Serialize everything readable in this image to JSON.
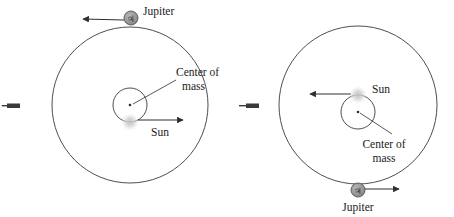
{
  "figure": {
    "background_color": "#ffffff",
    "stroke_color": "#3a3a3a",
    "jupiter_fill": "#9a9a9a",
    "jupiter_stroke": "#555555",
    "sun_fill": "#cccccc",
    "text_color": "#1a1a1a"
  },
  "panels": [
    {
      "id": "left-panel",
      "name": "panel-left",
      "orbit": {
        "center_x": 130,
        "center_y": 105,
        "radius": 78
      },
      "inner_circle": {
        "center_x": 130,
        "center_y": 105,
        "radius": 17
      },
      "center_of_mass": {
        "label_line_1": "Center of",
        "label_line_2": "mass",
        "dot_x": 130,
        "dot_y": 105,
        "label_x": 176,
        "label_y": 76
      },
      "sun": {
        "label": "Sun",
        "x": 130,
        "y": 122,
        "radius": 8,
        "arrow_direction": "right",
        "label_x": 151,
        "label_y": 136
      },
      "jupiter": {
        "label": "Jupiter",
        "symbol": "♃",
        "x": 131,
        "y": 18,
        "radius": 7,
        "arrow_direction": "left",
        "label_x": 143,
        "label_y": 15
      },
      "edge_marker": {
        "name": "edge-arrow-marker",
        "x": 8,
        "y": 106
      }
    },
    {
      "id": "right-panel",
      "name": "panel-right",
      "orbit": {
        "center_x": 358,
        "center_y": 105,
        "radius": 79
      },
      "inner_circle": {
        "center_x": 358,
        "center_y": 112,
        "radius": 17
      },
      "center_of_mass": {
        "label_line_1": "Center of",
        "label_line_2": "mass",
        "dot_x": 358,
        "dot_y": 112,
        "label_x": 384,
        "label_y": 144
      },
      "sun": {
        "label": "Sun",
        "x": 358,
        "y": 95,
        "radius": 8,
        "arrow_direction": "left",
        "label_x": 372,
        "label_y": 93
      },
      "jupiter": {
        "label": "Jupiter",
        "symbol": "♃",
        "x": 358,
        "y": 190,
        "radius": 7,
        "arrow_direction": "right",
        "label_x": 358,
        "label_y": 210
      },
      "edge_marker": {
        "name": "edge-arrow-marker",
        "x": 236,
        "y": 106
      }
    }
  ]
}
